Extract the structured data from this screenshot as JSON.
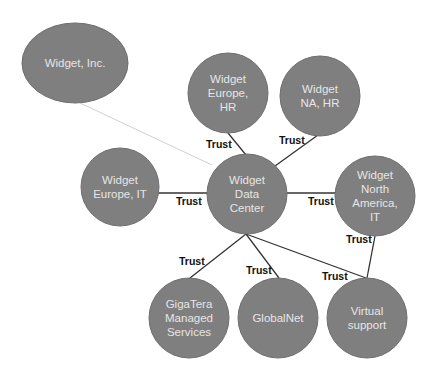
{
  "diagram": {
    "type": "trust-relationship-network",
    "colors": {
      "node_fill": "#7f7f7f",
      "node_text": "#e6e6e6",
      "edge": "#333333",
      "faint_edge": "#d0d0d0",
      "label": "#111111"
    },
    "nodes": [
      {
        "id": "widget-inc",
        "lines": [
          "Widget, Inc."
        ]
      },
      {
        "id": "europe-hr",
        "lines": [
          "Widget",
          "Europe,",
          "HR"
        ]
      },
      {
        "id": "na-hr",
        "lines": [
          "Widget",
          "NA, HR"
        ]
      },
      {
        "id": "europe-it",
        "lines": [
          "Widget",
          "Europe, IT"
        ]
      },
      {
        "id": "data-center",
        "lines": [
          "Widget",
          "Data",
          "Center"
        ]
      },
      {
        "id": "north-america-it",
        "lines": [
          "Widget",
          "North",
          "America,",
          "IT"
        ]
      },
      {
        "id": "gigatera",
        "lines": [
          "GigaTera",
          "Managed",
          "Services"
        ]
      },
      {
        "id": "globalnet",
        "lines": [
          "GlobalNet"
        ]
      },
      {
        "id": "virtual-support",
        "lines": [
          "Virtual",
          "support"
        ]
      }
    ],
    "edges": [
      {
        "from": "widget-inc",
        "to": "data-center",
        "label": "",
        "style": "faint"
      },
      {
        "from": "europe-hr",
        "to": "data-center",
        "label": "Trust"
      },
      {
        "from": "na-hr",
        "to": "data-center",
        "label": "Trust"
      },
      {
        "from": "europe-it",
        "to": "data-center",
        "label": "Trust"
      },
      {
        "from": "data-center",
        "to": "north-america-it",
        "label": "Trust"
      },
      {
        "from": "data-center",
        "to": "gigatera",
        "label": "Trust"
      },
      {
        "from": "data-center",
        "to": "globalnet",
        "label": "Trust"
      },
      {
        "from": "data-center",
        "to": "virtual-support",
        "label": "Trust"
      },
      {
        "from": "north-america-it",
        "to": "virtual-support",
        "label": "Trust"
      }
    ]
  }
}
